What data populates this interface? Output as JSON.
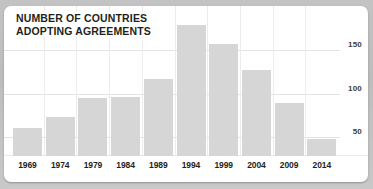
{
  "card": {
    "title": "NUMBER OF COUNTRIES\nADOPTING AGREEMENTS"
  },
  "chart_data": {
    "type": "bar",
    "title": "NUMBER OF COUNTRIES ADOPTING AGREEMENTS",
    "xlabel": "",
    "ylabel": "",
    "categories": [
      "1969",
      "1974",
      "1979",
      "1984",
      "1989",
      "1994",
      "1999",
      "2004",
      "2009",
      "2014"
    ],
    "values": [
      60,
      73,
      95,
      96,
      117,
      179,
      157,
      127,
      89,
      48
    ],
    "ytick_labels": [
      "50",
      "100",
      "150"
    ],
    "yticks": [
      50,
      100,
      150
    ],
    "ylim": [
      0,
      185
    ],
    "grid": true,
    "legend": "none",
    "bar_color": "#d6d6d6",
    "gridline_color": "#e3e3e3",
    "text_color": "#231f20",
    "background": "#ffffff"
  }
}
